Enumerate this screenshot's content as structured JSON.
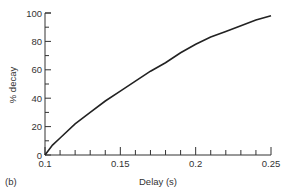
{
  "panel_label": "(b)",
  "chart_data": {
    "type": "line",
    "title": "",
    "xlabel": "Delay (s)",
    "ylabel": "% decay",
    "xlim": [
      0.1,
      0.25
    ],
    "ylim": [
      0,
      100
    ],
    "x_ticks": [
      "0.1",
      "0.15",
      "0.2",
      "0.25"
    ],
    "y_ticks": [
      "0",
      "20",
      "40",
      "60",
      "80",
      "100"
    ],
    "grid": false,
    "legend": null,
    "series": [
      {
        "name": "% decay",
        "x": [
          0.1,
          0.105,
          0.11,
          0.12,
          0.13,
          0.14,
          0.15,
          0.16,
          0.17,
          0.18,
          0.19,
          0.2,
          0.21,
          0.22,
          0.23,
          0.24,
          0.25
        ],
        "y": [
          0,
          7,
          12,
          22,
          30,
          38,
          45,
          52,
          59,
          65,
          72,
          78,
          83,
          87,
          91,
          95,
          98
        ]
      }
    ]
  }
}
